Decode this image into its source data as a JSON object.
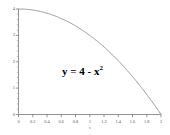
{
  "chart_data": {
    "type": "line",
    "title": "",
    "xlabel": "x",
    "ylabel": "",
    "xlim": [
      0,
      2
    ],
    "ylim": [
      0,
      4
    ],
    "grid": false,
    "legend": null,
    "annotations": [
      {
        "name": "curve-equation",
        "text_base": "y = 4 - x",
        "text_sup": "2",
        "full_text": "y = 4 - x²"
      }
    ],
    "x_ticks": [
      {
        "value": 0,
        "label": "0"
      },
      {
        "value": 0.2,
        "label": "0.2"
      },
      {
        "value": 0.4,
        "label": "0.4"
      },
      {
        "value": 0.6,
        "label": "0.6"
      },
      {
        "value": 0.8,
        "label": "0.8"
      },
      {
        "value": 1,
        "label": "1"
      },
      {
        "value": 1.2,
        "label": "1.2"
      },
      {
        "value": 1.4,
        "label": "1.4"
      },
      {
        "value": 1.6,
        "label": "1.6"
      },
      {
        "value": 1.8,
        "label": "1.8"
      },
      {
        "value": 2,
        "label": "2"
      }
    ],
    "y_ticks": [
      {
        "value": 0,
        "label": "0"
      },
      {
        "value": 1,
        "label": "1"
      },
      {
        "value": 2,
        "label": "2"
      },
      {
        "value": 3,
        "label": "3"
      },
      {
        "value": 4,
        "label": "4"
      }
    ],
    "y_minor_tick_step": 0.2,
    "series": [
      {
        "name": "y = 4 - x^2",
        "color": "#8a8a8a",
        "x": [
          0,
          0.1,
          0.2,
          0.3,
          0.4,
          0.5,
          0.6,
          0.7,
          0.8,
          0.9,
          1.0,
          1.1,
          1.2,
          1.3,
          1.4,
          1.5,
          1.6,
          1.7,
          1.8,
          1.9,
          2.0
        ],
        "values": [
          4,
          3.99,
          3.96,
          3.91,
          3.84,
          3.75,
          3.64,
          3.51,
          3.36,
          3.19,
          3.0,
          2.79,
          2.56,
          2.31,
          2.04,
          1.75,
          1.44,
          1.11,
          0.76,
          0.39,
          0
        ]
      }
    ],
    "colors": {
      "curve": "#8a8a8a",
      "axis": "#7a7a7a",
      "tick_label": "#555555",
      "annotation": "#000000",
      "background": "#ffffff"
    }
  }
}
